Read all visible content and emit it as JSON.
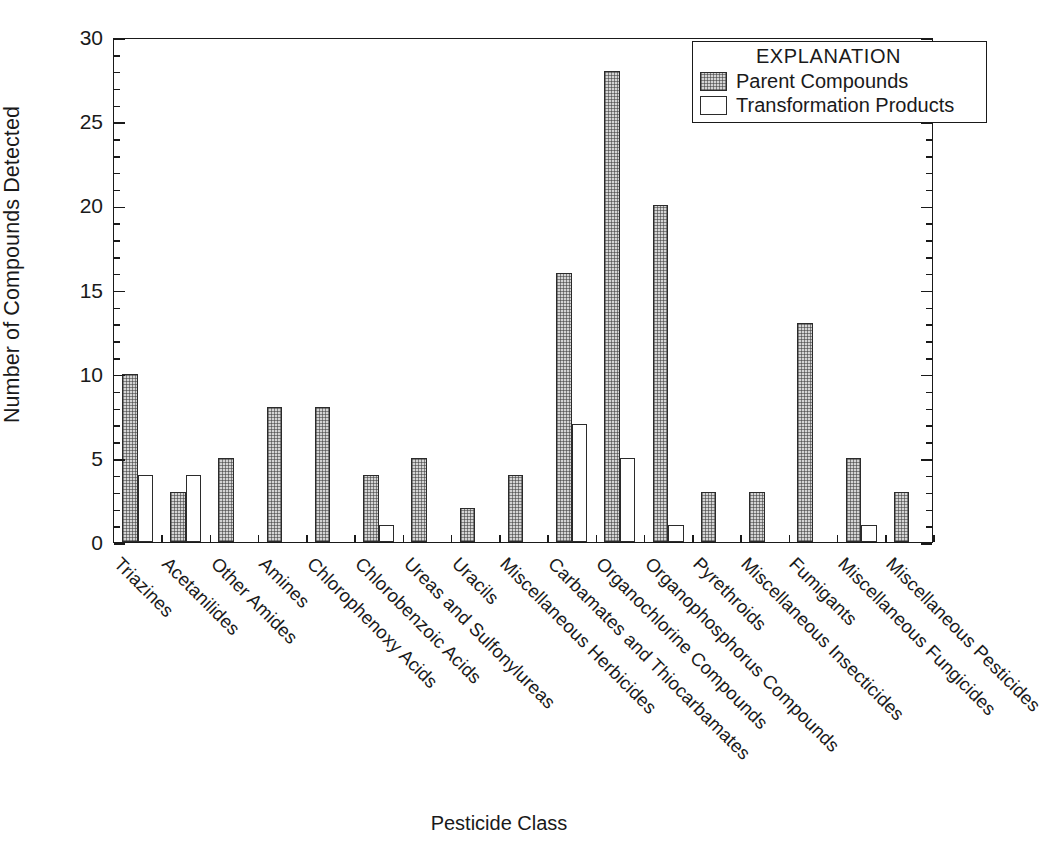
{
  "chart_data": {
    "type": "bar",
    "title": "",
    "xlabel": "Pesticide Class",
    "ylabel": "Number of Compounds Detected",
    "ylim": [
      0,
      30
    ],
    "ytick_labels": [
      "0",
      "5",
      "10",
      "15",
      "20",
      "25",
      "30"
    ],
    "ytick_values": [
      0,
      5,
      10,
      15,
      20,
      25,
      30
    ],
    "y_minor_tick_step": 1,
    "grid": false,
    "legend_position": "top-right",
    "legend_title": "EXPLANATION",
    "categories": [
      "Triazines",
      "Acetanilides",
      "Other Amides",
      "Amines",
      "Chlorophenoxy Acids",
      "Chlorobenzoic Acids",
      "Ureas and Sulfonylureas",
      "Uracils",
      "Miscellaneous Herbicides",
      "Carbamates and Thiocarbamates",
      "Organochlorine Compounds",
      "Organophosphorus Compounds",
      "Pyrethroids",
      "Miscellaneous Insecticides",
      "Fumigants",
      "Miscellaneous Fungicides",
      "Miscellaneous Pesticides"
    ],
    "series": [
      {
        "name": "Parent Compounds",
        "color": "#d4d4d4",
        "pattern": "stipple",
        "values": [
          10,
          3,
          5,
          8,
          8,
          4,
          5,
          2,
          4,
          16,
          28,
          20,
          3,
          3,
          13,
          5,
          3
        ]
      },
      {
        "name": "Transformation Products",
        "color": "#ffffff",
        "pattern": "solid",
        "values": [
          4,
          4,
          0,
          0,
          0,
          1,
          0,
          0,
          0,
          7,
          5,
          1,
          0,
          0,
          0,
          1,
          0
        ]
      }
    ]
  },
  "axes": {
    "y_title": "Number of Compounds Detected",
    "x_title": "Pesticide Class"
  },
  "legend": {
    "title": "EXPLANATION",
    "entries": [
      {
        "label": "Parent Compounds"
      },
      {
        "label": "Transformation Products"
      }
    ]
  },
  "colors": {
    "parent_fill": "#d4d4d4",
    "transformation_fill": "#ffffff",
    "axis": "#1a1a1a",
    "background": "#ffffff"
  }
}
